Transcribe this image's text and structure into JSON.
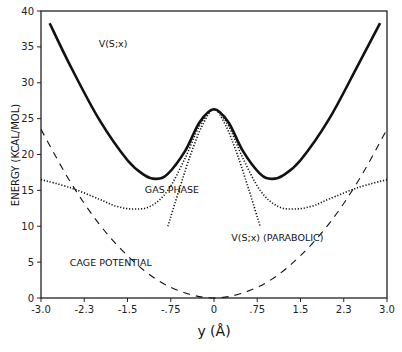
{
  "chart_data": {
    "type": "line",
    "title": "",
    "xlabel": "y (Å)",
    "ylabel": "ENERGY (KCAL/MOL)",
    "xlim": [
      -3.0,
      3.0
    ],
    "ylim": [
      0,
      40
    ],
    "x_ticks": [
      "-3.0",
      "-2.3",
      "-1.5",
      "-.75",
      "0",
      ".75",
      "1.5",
      "2.3",
      "3.0"
    ],
    "y_ticks": [
      "0",
      "5",
      "10",
      "15",
      "20",
      "25",
      "30",
      "35",
      "40"
    ],
    "grid": false,
    "legend": "inline annotations",
    "annotations": [
      {
        "text": "V(S;x)",
        "x": -2.0,
        "y": 35
      },
      {
        "text": "GAS PHASE",
        "x": -1.2,
        "y": 14.7
      },
      {
        "text": "V(S;x)  (PARABOLIC)",
        "x": 0.3,
        "y": 8
      },
      {
        "text": "CAGE POTENTIAL",
        "x": -2.5,
        "y": 4.5
      }
    ],
    "series": [
      {
        "name": "V(S;x)",
        "style": "solid-thick",
        "x": [
          -2.85,
          -2.5,
          -2.0,
          -1.5,
          -1.2,
          -1.0,
          -0.8,
          -0.5,
          -0.25,
          0,
          0.25,
          0.5,
          0.8,
          1.0,
          1.2,
          1.5,
          2.0,
          2.5,
          2.88
        ],
        "y": [
          38.3,
          32.5,
          25.0,
          19.2,
          17.1,
          16.6,
          17.3,
          20.5,
          24.5,
          26.3,
          24.5,
          20.5,
          17.3,
          16.6,
          17.1,
          19.2,
          25.0,
          32.5,
          38.3
        ]
      },
      {
        "name": "GAS PHASE",
        "style": "dotted",
        "x": [
          -3.0,
          -2.5,
          -2.0,
          -1.7,
          -1.4,
          -1.1,
          -0.8,
          -0.5,
          -0.25,
          0,
          0.25,
          0.5,
          0.8,
          1.1,
          1.4,
          1.7,
          2.0,
          2.5,
          3.0
        ],
        "y": [
          16.5,
          15.4,
          13.8,
          12.8,
          12.4,
          12.8,
          15.0,
          19.5,
          24.0,
          26.3,
          24.0,
          19.5,
          15.0,
          12.8,
          12.4,
          12.8,
          13.8,
          15.4,
          16.5
        ]
      },
      {
        "name": "V(S;x) (PARABOLIC)",
        "style": "dotted",
        "x": [
          -0.8,
          -0.6,
          -0.4,
          -0.2,
          0,
          0.2,
          0.4,
          0.6,
          0.8
        ],
        "y": [
          10.0,
          15.2,
          20.1,
          24.1,
          26.3,
          24.1,
          20.1,
          15.2,
          10.0
        ]
      },
      {
        "name": "CAGE POTENTIAL",
        "style": "dashed",
        "x": [
          -3.0,
          -2.5,
          -2.0,
          -1.5,
          -1.0,
          -0.5,
          0,
          0.5,
          1.0,
          1.5,
          2.0,
          2.5,
          3.0
        ],
        "y": [
          23.5,
          16.3,
          10.4,
          5.9,
          2.6,
          0.7,
          0,
          0.7,
          2.6,
          5.9,
          10.4,
          16.3,
          23.5
        ]
      }
    ]
  }
}
